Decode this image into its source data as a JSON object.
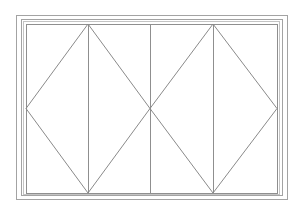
{
  "diagram": {
    "type": "window-elevation",
    "panel_count": 4,
    "colors": {
      "background": "#ffffff",
      "frame_line": "#a3a3a3",
      "frame_line_faint": "#c4c4c4",
      "panel_line": "#8f8f8f",
      "diagonal_line": "#8a8a8a"
    },
    "frames": [
      {
        "name": "outer-frame",
        "x": 16,
        "y": 15,
        "w": 271,
        "h": 184,
        "stroke": "#a3a3a3"
      },
      {
        "name": "frame-2",
        "x": 21,
        "y": 19,
        "w": 261,
        "h": 176,
        "stroke": "#a3a3a3"
      },
      {
        "name": "frame-3",
        "x": 23,
        "y": 21,
        "w": 256,
        "h": 173,
        "stroke": "#c4c4c4"
      },
      {
        "name": "inner-frame",
        "x": 26,
        "y": 24,
        "w": 251,
        "h": 169,
        "stroke": "#8f8f8f"
      }
    ],
    "mullions": [
      {
        "name": "mullion-1",
        "x": 88,
        "y1": 24,
        "y2": 193
      },
      {
        "name": "mullion-2",
        "x": 150,
        "y1": 24,
        "y2": 193
      },
      {
        "name": "mullion-3",
        "x": 213,
        "y1": 24,
        "y2": 193
      }
    ],
    "opening_indicators": [
      {
        "name": "diamond-left",
        "points": "88,24 26,108.5 88,193 150,108.5"
      },
      {
        "name": "diamond-right",
        "points": "213,24 150,108.5 213,193 277,108.5"
      }
    ]
  }
}
